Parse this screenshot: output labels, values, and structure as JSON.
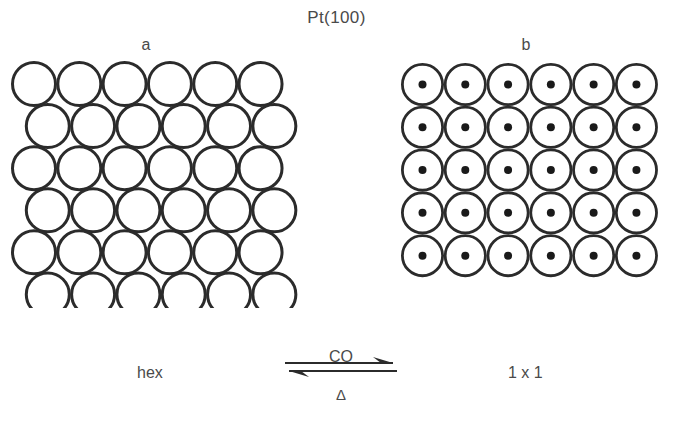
{
  "figure": {
    "title": "Pt(100)",
    "panels": [
      {
        "id": "a",
        "label": "a",
        "caption": "hex",
        "lattice_type": "hexagonal-close-packed",
        "rows": 6,
        "columns": 6,
        "circle_diameter_px": 46,
        "has_center_dot": false,
        "stroke_color": "#2b2b2b",
        "fill_color": "#ffffff"
      },
      {
        "id": "b",
        "label": "b",
        "caption": "1 x 1",
        "lattice_type": "square",
        "rows": 5,
        "columns": 6,
        "circle_diameter_px": 43,
        "has_center_dot": true,
        "dot_diameter_px": 8,
        "stroke_color": "#2b2b2b",
        "fill_color": "#ffffff",
        "dot_color": "#1a1a1a"
      }
    ],
    "transition": {
      "forward_label": "CO",
      "reverse_label": "Δ",
      "arrow_type": "reversible-harpoon",
      "forward_direction": "right",
      "reverse_direction": "left"
    },
    "colors": {
      "background": "#ffffff",
      "ink": "#2b2b2b",
      "text": "#4a4a4a"
    }
  },
  "chart_data": {
    "type": "diagram",
    "title": "Pt(100)",
    "panels": [
      {
        "label": "a",
        "phase": "hex",
        "geometry": "hexagonal close packed",
        "rows": 6,
        "columns": 6
      },
      {
        "label": "b",
        "phase": "1 x 1",
        "geometry": "square",
        "rows": 5,
        "columns": 6
      }
    ],
    "reaction": {
      "forward": "CO",
      "reverse": "Δ"
    }
  }
}
